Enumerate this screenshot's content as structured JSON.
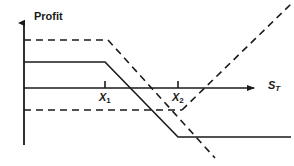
{
  "figure": {
    "title": "",
    "type": "option-payoff-diagram"
  },
  "axes": {
    "y_label": "Profit",
    "x_label": "S",
    "x_label_subscript": "T",
    "y_axis_x": 24,
    "x_axis_y": 88,
    "x_axis_start": 24,
    "x_axis_end": 255,
    "y_axis_top": 22,
    "y_axis_bottom": 145,
    "arrow_color": "#1a1a1a",
    "axis_color": "#1a1a1a",
    "grid": false
  },
  "strikes": [
    {
      "name": "X",
      "subscript": "1",
      "label": "X",
      "x": 105,
      "tick_top": 81,
      "tick_bottom": 88
    },
    {
      "name": "X",
      "subscript": "2",
      "label": "X",
      "x": 178,
      "tick_top": 81,
      "tick_bottom": 88
    }
  ],
  "series": [
    {
      "name": "solid-payoff",
      "style": "solid",
      "color": "#1a1a1a",
      "width": 1.6,
      "points": [
        [
          24,
          62
        ],
        [
          105,
          62
        ],
        [
          178,
          137
        ],
        [
          291,
          137
        ]
      ]
    },
    {
      "name": "dashed-payoff",
      "style": "dashed",
      "color": "#1a1a1a",
      "width": 1.6,
      "dash": "7,5",
      "points": [
        [
          24,
          40
        ],
        [
          108,
          40
        ],
        [
          215,
          158
        ]
      ]
    },
    {
      "name": "dashed-lower-flat",
      "style": "dashed",
      "color": "#1a1a1a",
      "width": 1.6,
      "dash": "7,5",
      "points": [
        [
          24,
          110
        ],
        [
          182,
          110
        ]
      ]
    },
    {
      "name": "dashed-rising",
      "style": "dashed",
      "color": "#1a1a1a",
      "width": 1.6,
      "dash": "7,5",
      "points": [
        [
          182,
          110
        ],
        [
          291,
          4
        ]
      ]
    }
  ],
  "chart_data": {
    "type": "line",
    "title": "",
    "xlabel": "S_T",
    "ylabel": "Profit",
    "annotations": [
      "X₁",
      "X₂"
    ],
    "legend": [],
    "series": [
      {
        "name": "solid-payoff",
        "style": "solid"
      },
      {
        "name": "dashed-payoff",
        "style": "dashed"
      }
    ]
  }
}
